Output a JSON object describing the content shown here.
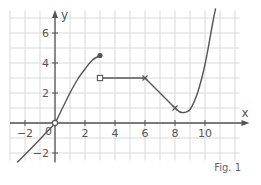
{
  "chart_data": {
    "type": "line",
    "title": "",
    "caption": "Fig. 1",
    "xlabel": "x",
    "ylabel": "y",
    "xlim": [
      -3,
      12.3
    ],
    "ylim": [
      -2.5,
      7.5
    ],
    "grid": true,
    "grid_step": 1,
    "x_ticks": [
      -2,
      0,
      2,
      4,
      6,
      8,
      10
    ],
    "y_ticks": [
      -2,
      2,
      4,
      6
    ],
    "origin_label": "0",
    "pieces": [
      {
        "name": "curve-1",
        "kind": "curve",
        "points": [
          [
            -2.5,
            -2.6
          ],
          [
            -1.5,
            -1.6
          ],
          [
            -0.5,
            -0.55
          ],
          [
            0,
            0
          ],
          [
            0.5,
            1.0
          ],
          [
            1,
            2.0
          ],
          [
            1.5,
            2.9
          ],
          [
            2,
            3.6
          ],
          [
            2.5,
            4.2
          ],
          [
            3,
            4.5
          ]
        ],
        "start_marker": {
          "at": [
            0,
            0
          ],
          "type": "open-circle"
        },
        "end_marker": {
          "at": [
            3,
            4.5
          ],
          "type": "filled-circle"
        }
      },
      {
        "name": "segment-horizontal",
        "kind": "line",
        "points": [
          [
            3,
            3
          ],
          [
            6,
            3
          ]
        ],
        "start_marker": {
          "at": [
            3,
            3
          ],
          "type": "open-square"
        },
        "end_marker": {
          "at": [
            6,
            3
          ],
          "type": "cross"
        }
      },
      {
        "name": "segment-decreasing",
        "kind": "line",
        "points": [
          [
            6,
            3
          ],
          [
            8,
            1
          ]
        ],
        "end_marker": {
          "at": [
            8,
            1
          ],
          "type": "cross"
        }
      },
      {
        "name": "curve-2",
        "kind": "curve",
        "points": [
          [
            8,
            1
          ],
          [
            8.3,
            0.75
          ],
          [
            8.6,
            0.7
          ],
          [
            9,
            0.9
          ],
          [
            9.5,
            2.0
          ],
          [
            10,
            3.9
          ],
          [
            10.5,
            6.6
          ],
          [
            10.7,
            7.6
          ]
        ]
      }
    ],
    "colors": {
      "grid": "#d9d9d9",
      "axis": "#555555",
      "curve": "#555555"
    }
  }
}
